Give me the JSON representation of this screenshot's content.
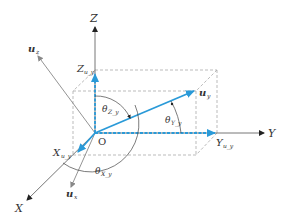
{
  "diagram": {
    "type": "3d-vector-decomposition",
    "origin_label": "O",
    "axes": [
      {
        "name": "X",
        "label": "X"
      },
      {
        "name": "Y",
        "label": "Y"
      },
      {
        "name": "Z",
        "label": "Z"
      }
    ],
    "vectors": [
      {
        "name": "u_y",
        "label": "u",
        "subscript": "y",
        "color": "#2a9ad8"
      },
      {
        "name": "u_x",
        "label": "u",
        "subscript": "x",
        "color": "#777777"
      },
      {
        "name": "u_z",
        "label": "u",
        "subscript": "z",
        "color": "#777777"
      }
    ],
    "projections": [
      {
        "name": "X_uy",
        "label": "X",
        "subscript": "u_y"
      },
      {
        "name": "Y_uy",
        "label": "Y",
        "subscript": "u_y"
      },
      {
        "name": "Z_uy",
        "label": "Z",
        "subscript": "u_y"
      }
    ],
    "angles": [
      {
        "name": "theta_Zy",
        "label": "θ",
        "subscript": "Z_y"
      },
      {
        "name": "theta_Yy",
        "label": "θ",
        "subscript": "Y_y"
      },
      {
        "name": "theta_Xy",
        "label": "θ",
        "subscript": "X_y"
      }
    ],
    "colors": {
      "vector": "#2a9ad8",
      "axis": "#555555",
      "dashed_box": "#aaaaaa"
    }
  }
}
